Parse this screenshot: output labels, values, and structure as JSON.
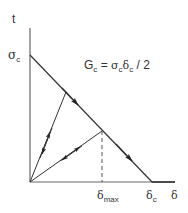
{
  "diagram": {
    "type": "traction-separation law",
    "axes": {
      "y_label": "t",
      "x_label": "δ"
    },
    "labels": {
      "sigma_c": "σ",
      "sigma_c_sub": "c",
      "delta_max": "δ",
      "delta_max_sub": "max",
      "delta_c": "δ",
      "delta_c_sub": "c",
      "equation_lhs": "G",
      "equation_lhs_sub": "c",
      "equation_eq": " = ",
      "equation_sigma": "σ",
      "equation_sigma_sub": "c",
      "equation_delta": "δ",
      "equation_delta_sub": "c",
      "equation_tail": " / 2"
    },
    "key_points": {
      "peak_traction": "σc",
      "critical_separation": "δc",
      "unload_separation": "δmax"
    },
    "colors": {
      "line": "#333333",
      "axis": "#555555"
    }
  }
}
